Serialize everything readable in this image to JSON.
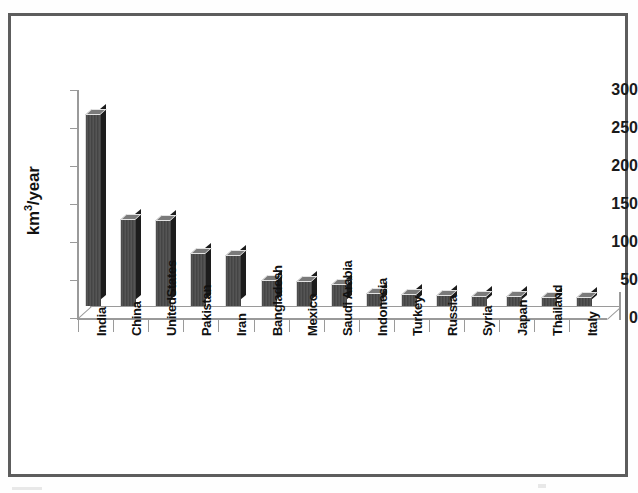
{
  "chart_data": {
    "type": "bar",
    "title": "",
    "xlabel": "",
    "ylabel": "km3/year",
    "ylabel_display": "km/year",
    "ylabel_superscript": "3",
    "ylim": [
      0,
      300
    ],
    "yticks": [
      0,
      50,
      100,
      150,
      200,
      250,
      300
    ],
    "grid": false,
    "legend": false,
    "style": "3d-column",
    "bar_color": "#4d4d4d",
    "bar_top_color": "#7a7a7a",
    "bar_side_color": "#1c1c1c",
    "axis_color": "#9a9a9a",
    "frame_color": "#5d5d5d",
    "categories": [
      "India",
      "China",
      "UnitedStates",
      "Pakistan",
      "Iran",
      "Bangladesh",
      "Mexico",
      "Saudi Arabia",
      "Indonesia",
      "Turkey",
      "Russia",
      "Syria",
      "Japan",
      "Thailand",
      "Italy"
    ],
    "values": [
      251,
      113,
      112,
      68,
      66,
      33,
      31,
      28,
      16,
      14,
      13,
      12,
      12,
      11,
      10
    ]
  },
  "axis": {
    "y_tick_labels": [
      "300",
      "250",
      "200",
      "150",
      "100",
      "50",
      "0"
    ],
    "y_title": "km/year",
    "y_title_sup": "3"
  }
}
